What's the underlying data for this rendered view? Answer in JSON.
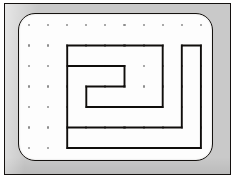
{
  "figure": {
    "kind": "geoboard-dot-grid-diagram",
    "frame": {
      "outline_color": "#14110f",
      "frame_color": "#c9c9c9",
      "board_color": "#fdfdfd",
      "board_corner_radius": 17
    },
    "grid": {
      "columns": 10,
      "rows": 7,
      "origin_x": 29,
      "origin_y": 25,
      "spacing_x": 19.1,
      "spacing_y": 20.5,
      "peg_color": "#8d8d8d",
      "peg_radius": 1.05
    },
    "shape": {
      "name": "spiral-polygon",
      "stroke_color": "#100e0c",
      "stroke_width": 1.9,
      "fill": "none",
      "closed": true,
      "vertices_grid": [
        [
          2,
          1
        ],
        [
          7,
          1
        ],
        [
          7,
          4
        ],
        [
          3,
          4
        ],
        [
          3,
          3
        ],
        [
          5,
          3
        ],
        [
          5,
          2
        ],
        [
          2,
          2
        ],
        [
          2,
          5
        ],
        [
          8,
          5
        ],
        [
          8,
          1
        ],
        [
          9,
          1
        ],
        [
          9,
          6
        ],
        [
          2,
          6
        ]
      ],
      "vertices_px": [
        [
          67.2,
          45.5
        ],
        [
          162.7,
          45.5
        ],
        [
          162.7,
          107.0
        ],
        [
          86.3,
          107.0
        ],
        [
          86.3,
          86.5
        ],
        [
          124.5,
          86.5
        ],
        [
          124.5,
          66.0
        ],
        [
          67.2,
          66.0
        ],
        [
          67.2,
          127.5
        ],
        [
          181.8,
          127.5
        ],
        [
          181.8,
          45.5
        ],
        [
          181.8,
          45.5
        ],
        [
          181.8,
          148.0
        ],
        [
          67.2,
          148.0
        ]
      ]
    }
  }
}
